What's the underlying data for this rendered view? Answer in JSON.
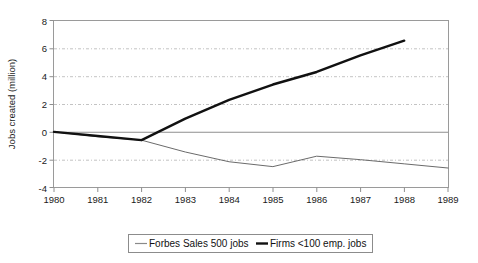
{
  "chart_data": {
    "type": "line",
    "title": "",
    "xlabel": "",
    "ylabel": "Jobs created (million)",
    "x": [
      1980,
      1981,
      1982,
      1983,
      1984,
      1985,
      1986,
      1987,
      1988,
      1989
    ],
    "xtick_labels": [
      "1980",
      "1981",
      "1982",
      "1983",
      "1984",
      "1985",
      "1986",
      "1987",
      "1988",
      "1989"
    ],
    "xlim": [
      1980,
      1989
    ],
    "ylim": [
      -4,
      8
    ],
    "ytick_labels": [
      "8",
      "6",
      "4",
      "2",
      "0",
      "-2",
      "-4"
    ],
    "ytick_values": [
      8,
      6,
      4,
      2,
      0,
      -2,
      -4
    ],
    "grid": true,
    "grid_style": "dash-dot horizontal",
    "zero_line": true,
    "legend_position": "below-center",
    "series": [
      {
        "name": "Forbes Sales 500 jobs",
        "color": "#6b6b6b",
        "width": "thin",
        "x": [
          1980,
          1981,
          1982,
          1983,
          1984,
          1985,
          1986,
          1987,
          1988,
          1989
        ],
        "values": [
          0.0,
          -0.35,
          -0.6,
          -1.45,
          -2.15,
          -2.5,
          -1.75,
          -2.0,
          -2.3,
          -2.6
        ]
      },
      {
        "name": "Firms <100 emp. jobs",
        "color": "#111111",
        "width": "thick",
        "x": [
          1980,
          1981,
          1982,
          1983,
          1984,
          1985,
          1986,
          1987,
          1988
        ],
        "values": [
          0.0,
          -0.3,
          -0.6,
          0.95,
          2.3,
          3.4,
          4.3,
          5.5,
          6.55
        ]
      }
    ]
  },
  "legend": {
    "items": [
      {
        "label": "Forbes Sales 500 jobs",
        "swatch": "thin-gray-line"
      },
      {
        "label": "Firms <100 emp. jobs",
        "swatch": "thick-black-line"
      }
    ]
  },
  "colors": {
    "series_forbes": "#6b6b6b",
    "series_firms": "#111111",
    "grid": "#b4b4b4",
    "frame": "#9a9a9a",
    "background": "#ffffff"
  }
}
